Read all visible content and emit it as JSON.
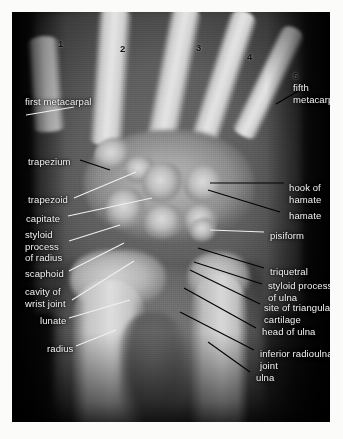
{
  "image": {
    "kind": "radiograph",
    "view": "hand and wrist X-ray, anteroposterior view",
    "film_background": "#0a0a0a",
    "label_color": "#f2f2f2",
    "digit_color": "#111111",
    "leader_color": "#000000"
  },
  "digits": [
    {
      "label": "1",
      "x": 46,
      "y": 26
    },
    {
      "label": "2",
      "x": 108,
      "y": 31
    },
    {
      "label": "3",
      "x": 184,
      "y": 30
    },
    {
      "label": "4",
      "x": 235,
      "y": 39
    },
    {
      "label": "5",
      "x": 281,
      "y": 58
    }
  ],
  "labels_left": [
    {
      "name": "first-metacarpal",
      "text": "first metacarpal",
      "x": 13,
      "y": 84
    },
    {
      "name": "trapezium",
      "text": "trapezium",
      "x": 16,
      "y": 144
    },
    {
      "name": "trapezoid",
      "text": "trapezoid",
      "x": 16,
      "y": 182
    },
    {
      "name": "capitate",
      "text": "capitate",
      "x": 14,
      "y": 201
    },
    {
      "name": "styloid-process-of-radius",
      "text": "styloid\nprocess\nof radius",
      "x": 13,
      "y": 217
    },
    {
      "name": "scaphoid",
      "text": "scaphoid",
      "x": 13,
      "y": 256
    },
    {
      "name": "cavity-of-wrist-joint",
      "text": "cavity of\nwrist joint",
      "x": 13,
      "y": 274
    },
    {
      "name": "lunate",
      "text": "lunate",
      "x": 28,
      "y": 303
    },
    {
      "name": "radius",
      "text": "radius",
      "x": 35,
      "y": 331
    }
  ],
  "labels_right": [
    {
      "name": "fifth-metacarpal",
      "text": "fifth\nmetacarpal",
      "x": 281,
      "y": 70
    },
    {
      "name": "hook-of-hamate",
      "text": "hook of\nhamate",
      "x": 277,
      "y": 170
    },
    {
      "name": "hamate",
      "text": "hamate",
      "x": 277,
      "y": 198
    },
    {
      "name": "pisiform",
      "text": "pisiform",
      "x": 258,
      "y": 218
    },
    {
      "name": "triquetral",
      "text": "triquetral",
      "x": 258,
      "y": 254
    },
    {
      "name": "styloid-process-of-ulna",
      "text": "styloid process\nof ulna",
      "x": 256,
      "y": 268
    },
    {
      "name": "site-of-triangular-cartilage",
      "text": "site of triangular\ncartilage",
      "x": 252,
      "y": 290
    },
    {
      "name": "head-of-ulna",
      "text": "head of ulna",
      "x": 250,
      "y": 314
    },
    {
      "name": "inferior-radioulnar-joint",
      "text": "inferior radioulnar\njoint",
      "x": 248,
      "y": 336
    },
    {
      "name": "ulna",
      "text": "ulna",
      "x": 244,
      "y": 360
    }
  ],
  "leaders_left": [
    {
      "name": "leader-first-metacarpal",
      "x1": 14,
      "y1": 103,
      "x2": 62,
      "y2": 95
    },
    {
      "name": "leader-trapezium",
      "x1": 68,
      "y1": 148,
      "x2": 98,
      "y2": 158
    },
    {
      "name": "leader-trapezoid",
      "x1": 62,
      "y1": 186,
      "x2": 124,
      "y2": 160
    },
    {
      "name": "leader-capitate",
      "x1": 56,
      "y1": 204,
      "x2": 140,
      "y2": 186
    },
    {
      "name": "leader-styloid-radius",
      "x1": 57,
      "y1": 229,
      "x2": 108,
      "y2": 213
    },
    {
      "name": "leader-scaphoid",
      "x1": 57,
      "y1": 259,
      "x2": 112,
      "y2": 231
    },
    {
      "name": "leader-cavity-wrist",
      "x1": 60,
      "y1": 288,
      "x2": 122,
      "y2": 249
    },
    {
      "name": "leader-lunate",
      "x1": 57,
      "y1": 306,
      "x2": 118,
      "y2": 288
    },
    {
      "name": "leader-radius",
      "x1": 64,
      "y1": 334,
      "x2": 104,
      "y2": 318
    }
  ],
  "leaders_right": [
    {
      "name": "leader-fifth-metacarpal",
      "x1": 264,
      "y1": 92,
      "x2": 288,
      "y2": 78
    },
    {
      "name": "leader-hook-of-hamate",
      "x1": 198,
      "y1": 171,
      "x2": 272,
      "y2": 171
    },
    {
      "name": "leader-hamate",
      "x1": 196,
      "y1": 178,
      "x2": 268,
      "y2": 200
    },
    {
      "name": "leader-pisiform",
      "x1": 198,
      "y1": 218,
      "x2": 252,
      "y2": 220
    },
    {
      "name": "leader-triquetral",
      "x1": 186,
      "y1": 236,
      "x2": 252,
      "y2": 256
    },
    {
      "name": "leader-styloid-ulna",
      "x1": 182,
      "y1": 250,
      "x2": 250,
      "y2": 272
    },
    {
      "name": "leader-triangular-cartilage",
      "x1": 178,
      "y1": 258,
      "x2": 248,
      "y2": 292
    },
    {
      "name": "leader-head-of-ulna",
      "x1": 172,
      "y1": 276,
      "x2": 244,
      "y2": 316
    },
    {
      "name": "leader-inferior-radioulnar",
      "x1": 168,
      "y1": 300,
      "x2": 242,
      "y2": 338
    },
    {
      "name": "leader-ulna",
      "x1": 196,
      "y1": 330,
      "x2": 238,
      "y2": 360
    }
  ],
  "metacarpals": [
    {
      "name": "metacarpal-1",
      "left": 18,
      "top": 24,
      "width": 32,
      "height": 96,
      "rotate": -4
    },
    {
      "name": "metacarpal-2",
      "left": 82,
      "top": -6,
      "width": 34,
      "height": 140,
      "rotate": 4
    },
    {
      "name": "metacarpal-3",
      "left": 146,
      "top": -8,
      "width": 32,
      "height": 142,
      "rotate": 11
    },
    {
      "name": "metacarpal-4",
      "left": 198,
      "top": -4,
      "width": 29,
      "height": 136,
      "rotate": 18
    },
    {
      "name": "metacarpal-5",
      "left": 244,
      "top": 10,
      "width": 26,
      "height": 120,
      "rotate": 26
    }
  ],
  "carpals": [
    {
      "name": "carpal-trapezium",
      "left": 82,
      "top": 126,
      "width": 40,
      "height": 36
    },
    {
      "name": "carpal-trapezoid",
      "left": 112,
      "top": 144,
      "width": 34,
      "height": 30
    },
    {
      "name": "carpal-capitate",
      "left": 130,
      "top": 150,
      "width": 44,
      "height": 46
    },
    {
      "name": "carpal-hamate",
      "left": 172,
      "top": 152,
      "width": 44,
      "height": 44
    },
    {
      "name": "carpal-scaphoid",
      "left": 94,
      "top": 176,
      "width": 42,
      "height": 44
    },
    {
      "name": "carpal-lunate",
      "left": 132,
      "top": 192,
      "width": 42,
      "height": 38
    },
    {
      "name": "carpal-triquetral",
      "left": 172,
      "top": 192,
      "width": 36,
      "height": 34
    },
    {
      "name": "carpal-pisiform",
      "left": 178,
      "top": 206,
      "width": 28,
      "height": 26
    }
  ]
}
